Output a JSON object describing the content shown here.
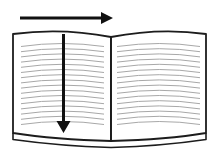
{
  "colors": {
    "background": "#ffffff",
    "page_fill": "#ffffff",
    "outline": "#1c1c1c",
    "arrow": "#111111",
    "ruled_line": "#a8a8a8"
  },
  "diagram": {
    "type": "open-book-reading-direction",
    "book": {
      "pages": 2,
      "ruled_lines_per_page": 16
    },
    "arrows": [
      {
        "id": "horizontal-arrow",
        "orientation": "horizontal",
        "direction": "right",
        "position": "above-book"
      },
      {
        "id": "vertical-arrow",
        "orientation": "vertical",
        "direction": "down",
        "position": "center-of-left-page"
      }
    ]
  }
}
